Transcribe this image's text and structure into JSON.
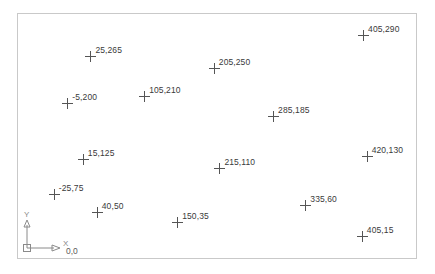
{
  "frame": {
    "border_color": "#c9c9c9",
    "background": "#ffffff"
  },
  "chart_data": {
    "type": "scatter",
    "title": "",
    "xlabel": "X",
    "ylabel": "Y",
    "grid": false,
    "legend": null,
    "marker": "cross",
    "marker_color": "#555555",
    "label_color": "#3a3a3a",
    "xlim": [
      -40,
      440
    ],
    "ylim": [
      0,
      300
    ],
    "points": [
      {
        "label": "25,265",
        "x": 25,
        "y": 265,
        "px": 18.2,
        "py": 17.2
      },
      {
        "label": "405,290",
        "x": 405,
        "y": 290,
        "px": 86.7,
        "py": 8.8
      },
      {
        "label": "205,250",
        "x": 205,
        "y": 250,
        "px": 49.2,
        "py": 22.3
      },
      {
        "label": "105,210",
        "x": 105,
        "y": 210,
        "px": 31.7,
        "py": 33.6
      },
      {
        "label": "-5,200",
        "x": -5,
        "y": 200,
        "px": 12.4,
        "py": 36.5
      },
      {
        "label": "285,185",
        "x": 285,
        "y": 185,
        "px": 64.1,
        "py": 42.0
      },
      {
        "label": "420,130",
        "x": 420,
        "y": 130,
        "px": 87.6,
        "py": 58.0
      },
      {
        "label": "15,125",
        "x": 15,
        "y": 125,
        "px": 16.3,
        "py": 59.5
      },
      {
        "label": "215,110",
        "x": 215,
        "y": 110,
        "px": 50.6,
        "py": 63.1
      },
      {
        "label": "-25,75",
        "x": -25,
        "y": 75,
        "px": 9.0,
        "py": 73.7
      },
      {
        "label": "335,60",
        "x": 335,
        "y": 60,
        "px": 72.2,
        "py": 78.1
      },
      {
        "label": "40,50",
        "x": 40,
        "y": 50,
        "px": 19.8,
        "py": 81.0
      },
      {
        "label": "150,35",
        "x": 150,
        "y": 35,
        "px": 40.0,
        "py": 85.4
      },
      {
        "label": "405,15",
        "x": 405,
        "y": 15,
        "px": 86.4,
        "py": 90.9
      }
    ]
  },
  "ucs": {
    "x_axis_label": "X",
    "y_axis_label": "Y",
    "origin_label": "0,0",
    "stroke_color": "#8a8a8a"
  }
}
